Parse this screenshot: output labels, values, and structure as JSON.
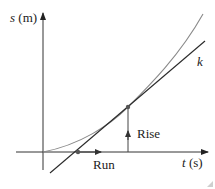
{
  "diagram": {
    "y_axis": {
      "var": "s",
      "unit": "(m)"
    },
    "x_axis": {
      "var": "t",
      "unit": "(s)"
    },
    "tangent_label": "k",
    "run_label": "Run",
    "rise_label": "Rise",
    "colors": {
      "axis": "#333333",
      "curve": "#8a8a8a",
      "tangent": "#2a2a2a",
      "point": "#555555"
    }
  }
}
